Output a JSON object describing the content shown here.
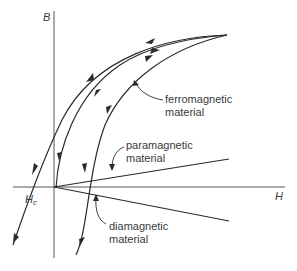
{
  "diagram": {
    "title": "",
    "axes": {
      "y_label": "B",
      "x_label": "H",
      "coercivity_label": "H",
      "coercivity_subscript": "c"
    },
    "labels": {
      "ferromagnetic": [
        "ferromagnetic",
        "material"
      ],
      "paramagnetic": [
        "paramagnetic",
        "material"
      ],
      "diamagnetic": [
        "diamagnetic",
        "material"
      ]
    },
    "curves": [
      {
        "name": "ferromagnetic-hysteresis-descending",
        "direction": "toward -H"
      },
      {
        "name": "ferromagnetic-hysteresis-ascending",
        "direction": "toward +H"
      },
      {
        "name": "ferromagnetic-initial-magnetization",
        "direction": "toward +H"
      },
      {
        "name": "paramagnetic-line",
        "slope": "positive small"
      },
      {
        "name": "diamagnetic-line",
        "slope": "negative small"
      }
    ],
    "colors": {
      "line": "#2a2a2a",
      "axis": "#555555",
      "text": "#3a3a3a",
      "background": "#ffffff"
    }
  }
}
